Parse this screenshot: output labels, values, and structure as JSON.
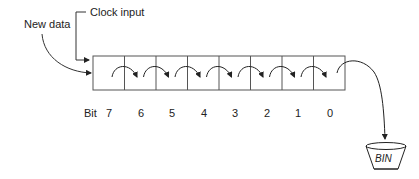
{
  "labels": {
    "new_data": "New data",
    "clock_input": "Clock input",
    "bit": "Bit",
    "bin": "BIN"
  },
  "register": {
    "cell_count": 8,
    "bits": [
      "7",
      "6",
      "5",
      "4",
      "3",
      "2",
      "1",
      "0"
    ]
  },
  "colors": {
    "line": "#333333",
    "box": "#555555"
  }
}
